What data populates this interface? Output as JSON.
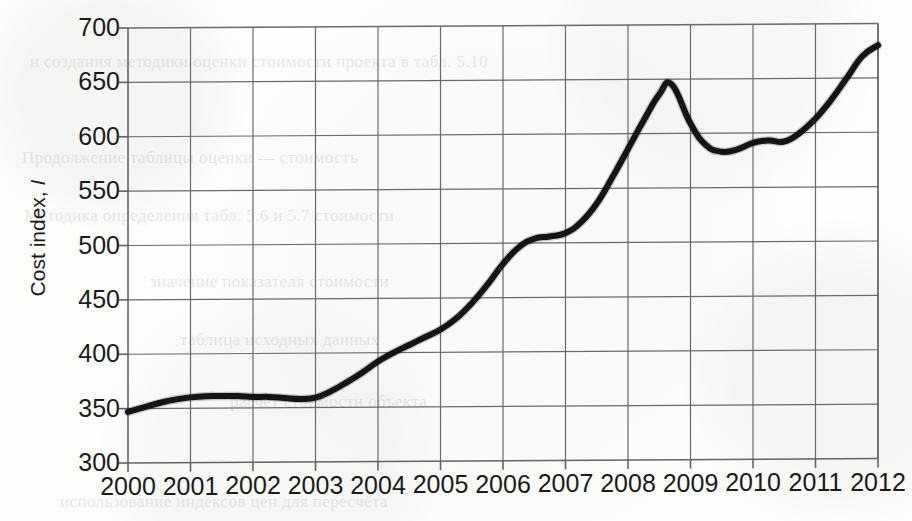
{
  "figure": {
    "kind": "scanned-line-chart",
    "ylabel_text": "Cost index,",
    "ylabel_symbol": "I",
    "ink_color": "#141414",
    "grid_color": "#636363",
    "page_color": "#fdfdfc"
  },
  "bleed_through_text": [
    {
      "text": "н создания методики оценки стоимости проекта в табл. 5.10",
      "x": 30,
      "y": 52,
      "size": 17
    },
    {
      "text": "Продолжение таблицы оценки  —  стоимость",
      "x": 22,
      "y": 148,
      "size": 17
    },
    {
      "text": "Методика определения  табл. 5.6 и 5.7  стоимости",
      "x": 24,
      "y": 206,
      "size": 17
    },
    {
      "text": "значение показателя стоимости",
      "x": 150,
      "y": 272,
      "size": 17
    },
    {
      "text": "таблица исходных данных",
      "x": 180,
      "y": 330,
      "size": 17
    },
    {
      "text": "расчёт стоимости объекта",
      "x": 230,
      "y": 392,
      "size": 17
    },
    {
      "text": "использование индексов цен для пересчёта",
      "x": 60,
      "y": 492,
      "size": 17
    }
  ],
  "chart_data": {
    "type": "line",
    "title": "",
    "xlabel": "",
    "ylabel": "Cost index, I",
    "xlim": [
      2000,
      2012
    ],
    "ylim": [
      300,
      700
    ],
    "yticks": [
      300,
      350,
      400,
      450,
      500,
      550,
      600,
      650,
      700
    ],
    "xticks": [
      2000,
      2001,
      2002,
      2003,
      2004,
      2005,
      2006,
      2007,
      2008,
      2009,
      2010,
      2011,
      2012
    ],
    "grid": true,
    "legend": null,
    "series": [
      {
        "name": "Cost index",
        "color": "#141414",
        "linewidth": 6,
        "x": [
          2000.0,
          2000.25,
          2000.5,
          2000.75,
          2001.0,
          2001.25,
          2001.5,
          2001.75,
          2002.0,
          2002.25,
          2002.5,
          2002.75,
          2003.0,
          2003.25,
          2003.5,
          2003.75,
          2004.0,
          2004.25,
          2004.5,
          2004.75,
          2005.0,
          2005.25,
          2005.5,
          2005.75,
          2006.0,
          2006.25,
          2006.5,
          2006.75,
          2007.0,
          2007.25,
          2007.5,
          2007.75,
          2008.0,
          2008.25,
          2008.5,
          2008.7,
          2009.0,
          2009.25,
          2009.5,
          2009.75,
          2010.0,
          2010.25,
          2010.5,
          2010.75,
          2011.0,
          2011.25,
          2011.5,
          2011.75,
          2012.0
        ],
        "y": [
          347,
          351,
          355,
          358,
          360,
          361,
          361,
          361,
          360,
          360,
          359,
          358,
          359,
          365,
          373,
          382,
          392,
          400,
          407,
          414,
          421,
          431,
          445,
          462,
          481,
          496,
          504,
          506,
          509,
          519,
          536,
          560,
          586,
          612,
          636,
          645,
          609,
          589,
          583,
          585,
          591,
          593,
          592,
          600,
          613,
          630,
          650,
          670,
          680
        ]
      }
    ]
  }
}
